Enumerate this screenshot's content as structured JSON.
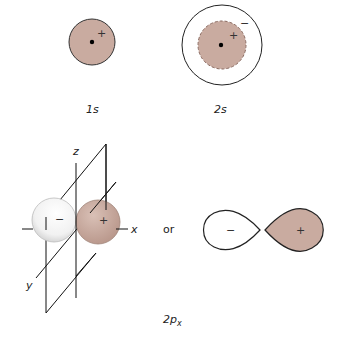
{
  "colors": {
    "positive_fill": "#c9aba0",
    "negative_fill": "#ffffff",
    "stroke": "#222222"
  },
  "orbitals": {
    "s1": {
      "label": "1s",
      "sign": "+"
    },
    "s2": {
      "label": "2s",
      "inner_sign": "+",
      "outer_sign": "−"
    },
    "p2x": {
      "label": "2px",
      "label_main": "2p",
      "label_sub": "x",
      "axes": {
        "z": "z",
        "x": "x",
        "y": "y"
      },
      "left_lobe_sign": "−",
      "right_lobe_sign": "+",
      "connector": "or",
      "simplified": {
        "left_sign": "−",
        "right_sign": "+"
      }
    }
  }
}
